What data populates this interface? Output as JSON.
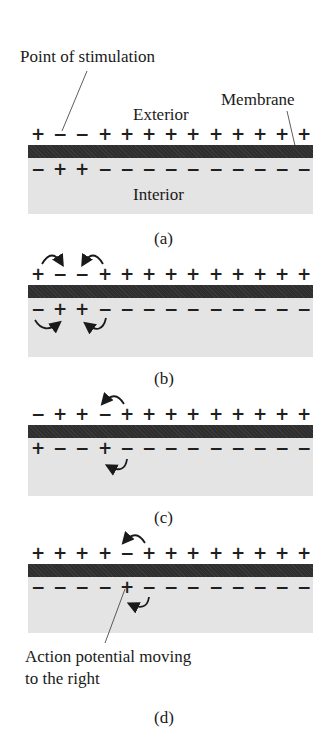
{
  "labels": {
    "point_of_stimulation": "Point of stimulation",
    "membrane": "Membrane",
    "exterior": "Exterior",
    "interior": "Interior",
    "action_potential_line1": "Action potential moving",
    "action_potential_line2": "to the right"
  },
  "panels": [
    {
      "id": "a",
      "caption": "(a)",
      "exterior_charges": [
        "+",
        "−",
        "−",
        "+",
        "+",
        "+",
        "+",
        "+",
        "+",
        "+",
        "+",
        "+",
        "+"
      ],
      "interior_charges": [
        "−",
        "+",
        "+",
        "−",
        "−",
        "−",
        "−",
        "−",
        "−",
        "−",
        "−",
        "−",
        "−"
      ],
      "current_arrows": []
    },
    {
      "id": "b",
      "caption": "(b)",
      "exterior_charges": [
        "+",
        "−",
        "−",
        "+",
        "+",
        "+",
        "+",
        "+",
        "+",
        "+",
        "+",
        "+",
        "+"
      ],
      "interior_charges": [
        "−",
        "+",
        "+",
        "−",
        "−",
        "−",
        "−",
        "−",
        "−",
        "−",
        "−",
        "−",
        "−"
      ],
      "current_arrows": [
        {
          "side": "exterior",
          "from_index": 0,
          "to_index": 1
        },
        {
          "side": "exterior",
          "from_index": 3,
          "to_index": 2
        },
        {
          "side": "interior",
          "from_index": 0,
          "to_index": 1
        },
        {
          "side": "interior",
          "from_index": 3,
          "to_index": 2
        }
      ]
    },
    {
      "id": "c",
      "caption": "(c)",
      "exterior_charges": [
        "−",
        "+",
        "+",
        "−",
        "+",
        "+",
        "+",
        "+",
        "+",
        "+",
        "+",
        "+",
        "+"
      ],
      "interior_charges": [
        "+",
        "−",
        "−",
        "+",
        "−",
        "−",
        "−",
        "−",
        "−",
        "−",
        "−",
        "−",
        "−"
      ],
      "current_arrows": [
        {
          "side": "exterior",
          "from_index": 4,
          "to_index": 3
        },
        {
          "side": "interior",
          "from_index": 4,
          "to_index": 3
        }
      ]
    },
    {
      "id": "d",
      "caption": "(d)",
      "exterior_charges": [
        "+",
        "+",
        "+",
        "+",
        "−",
        "+",
        "+",
        "+",
        "+",
        "+",
        "+",
        "+",
        "+"
      ],
      "interior_charges": [
        "−",
        "−",
        "−",
        "−",
        "+",
        "−",
        "−",
        "−",
        "−",
        "−",
        "−",
        "−",
        "−"
      ],
      "current_arrows": [
        {
          "side": "exterior",
          "from_index": 5,
          "to_index": 4
        },
        {
          "side": "interior",
          "from_index": 5,
          "to_index": 4
        }
      ]
    }
  ]
}
